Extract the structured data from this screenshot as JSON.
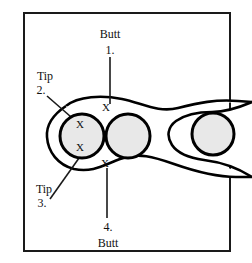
{
  "figure": {
    "width": 252,
    "height": 263,
    "background_color": "#ffffff",
    "frame": {
      "stroke_color": "#1a1a1a",
      "x": 24,
      "y": 13,
      "width": 206,
      "height": 238
    },
    "colors": {
      "outline": "#000000",
      "vesicle_fill": "#e8e8e8",
      "text": "#111111",
      "leader": "#1a1a1a"
    }
  },
  "labels": {
    "top": {
      "name_label": "Butt",
      "number_label": "1.",
      "name_x": 110,
      "name_y": 35,
      "number_x": 110,
      "number_y": 51
    },
    "upper_left": {
      "name_label": "Tip",
      "number_label": "2.",
      "name_x": 45,
      "name_y": 77,
      "number_x": 41,
      "number_y": 91
    },
    "lower_left": {
      "name_label": "Tip",
      "number_label": "3.",
      "name_x": 44,
      "name_y": 190,
      "number_x": 42,
      "number_y": 204
    },
    "bottom": {
      "number_label": "4.",
      "name_label": "Butt",
      "number_x": 108,
      "number_y": 228,
      "name_y": 244,
      "name_x": 108
    }
  },
  "marks": {
    "glyph": "X",
    "points": [
      {
        "id": "x-top-center",
        "x": 106,
        "y": 108
      },
      {
        "id": "x-left-upper",
        "x": 80,
        "y": 125
      },
      {
        "id": "x-left-lower",
        "x": 80,
        "y": 148
      },
      {
        "id": "x-bottom-center",
        "x": 105,
        "y": 164
      }
    ]
  },
  "vesicles": [
    {
      "id": "vesicle-left",
      "cx": 82,
      "cy": 136,
      "r": 22,
      "has_marks": true
    },
    {
      "id": "vesicle-middle",
      "cx": 128,
      "cy": 136,
      "r": 22,
      "has_marks": false
    },
    {
      "id": "vesicle-right",
      "cx": 213,
      "cy": 134,
      "r": 21,
      "has_marks": false
    }
  ],
  "leaders": [
    {
      "id": "leader-1-butt-top",
      "x1": 110,
      "y1": 57,
      "x2": 110,
      "y2": 104
    },
    {
      "id": "leader-2-tip-upper",
      "x1": 47,
      "y1": 96,
      "x2": 85,
      "y2": 129
    },
    {
      "id": "leader-3-tip-lower",
      "x1": 50,
      "y1": 199,
      "x2": 83,
      "y2": 151
    },
    {
      "id": "leader-4-butt-bottom",
      "x1": 107,
      "y1": 168,
      "x2": 107,
      "y2": 218
    }
  ],
  "outline_path": {
    "description": "peanut-shaped organ outline with two lobes and a narrow waist",
    "d": "M 66 106 C 78 96, 100 95, 120 99 C 140 103, 156 112, 176 107 C 196 102, 214 98, 236 100 L 252 101 L 252 176 L 234 176 C 212 176, 192 170, 172 163 C 152 156, 136 154, 118 161 C 100 168, 84 172, 70 166 C 54 159, 46 144, 48 131 C 50 118, 56 112, 66 106 Z"
  }
}
